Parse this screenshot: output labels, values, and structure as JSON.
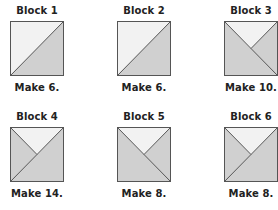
{
  "colors": {
    "light": "#f2f2f2",
    "dark": "#d0d0d0",
    "stroke": "#555555",
    "text": "#222222"
  },
  "blocks": [
    {
      "title": "Block 1",
      "caption": "Make 6.",
      "pattern": "half-diagonal-dark-bottom-right"
    },
    {
      "title": "Block 2",
      "caption": "Make 6.",
      "pattern": "half-diagonal-dark-bottom-right"
    },
    {
      "title": "Block 3",
      "caption": "Make 10.",
      "pattern": "quarter-triangle-light-top"
    },
    {
      "title": "Block 4",
      "caption": "Make 14.",
      "pattern": "quarter-triangle-light-top-diag-bl"
    },
    {
      "title": "Block 5",
      "caption": "Make 8.",
      "pattern": "quarter-triangle-light-top"
    },
    {
      "title": "Block 6",
      "caption": "Make 8.",
      "pattern": "quarter-triangle-light-top-diag-bl"
    }
  ]
}
